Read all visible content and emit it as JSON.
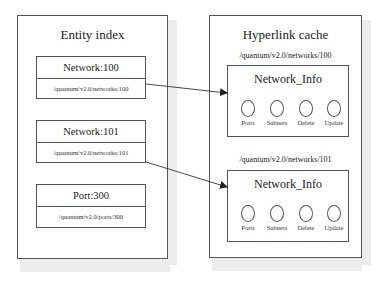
{
  "entity_index": {
    "title": "Entity index",
    "entries": [
      {
        "name": "Network:100",
        "url": "/quantum/v2.0/networks/100"
      },
      {
        "name": "Network:101",
        "url": "/quantum/v2.0/networks/101"
      },
      {
        "name": "Port:300",
        "url": "/quantum/v2.0/ports/300"
      }
    ]
  },
  "hyperlink_cache": {
    "title": "Hyperlink cache",
    "entries": [
      {
        "url": "/quantum/v2.0/networks/100",
        "name": "Network_Info",
        "operations": [
          "Ports",
          "Subnets",
          "Delete",
          "Update"
        ]
      },
      {
        "url": "/quantum/v2.0/networks/101",
        "name": "Network_Info",
        "operations": [
          "Ports",
          "Subnets",
          "Delete",
          "Update"
        ]
      }
    ]
  },
  "links": [
    {
      "from": "Network:100",
      "to": "/quantum/v2.0/networks/100"
    },
    {
      "from": "Network:101",
      "to": "/quantum/v2.0/networks/101"
    }
  ]
}
